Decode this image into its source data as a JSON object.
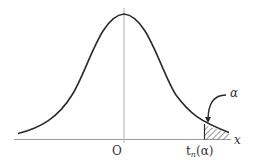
{
  "diagram": {
    "labels": {
      "origin": "O",
      "x_axis": "x",
      "alpha": "α",
      "critical_t": "t",
      "critical_sub": "n",
      "critical_arg": "(α)"
    },
    "colors": {
      "curve": "#2a2a2a",
      "axis": "#9a9a9a",
      "hatch": "#333333",
      "text": "#333333"
    }
  }
}
